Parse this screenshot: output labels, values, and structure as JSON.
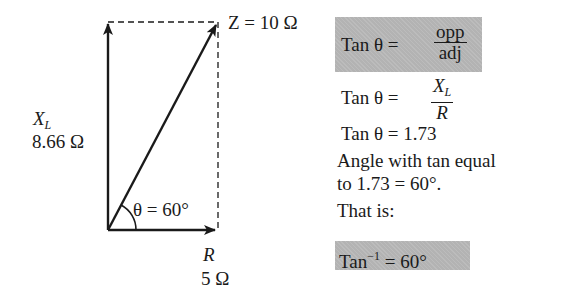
{
  "diagram": {
    "type": "impedance-vector-diagram",
    "impedance": {
      "symbol": "Z",
      "value": "Z = 10 Ω"
    },
    "reactance": {
      "symbol": "X",
      "subscript": "L",
      "value": "8.66 Ω"
    },
    "resistance": {
      "symbol": "R",
      "value": "5 Ω"
    },
    "angle": {
      "label": "θ = 60°"
    }
  },
  "equations": {
    "box1": {
      "prefix": "Tan  θ =",
      "numerator": "opp",
      "denominator": "adj"
    },
    "line2": {
      "prefix": "Tan  θ =",
      "num_symbol": "X",
      "num_sub": "L",
      "denominator": "R"
    },
    "line3": "Tan  θ = 1.73",
    "line4": "Angle with tan equal",
    "line5": "to 1.73 = 60°.",
    "line6": "That is:",
    "box2": {
      "prefix": "Tan",
      "superscript": "−1",
      "suffix": " = 60°"
    }
  },
  "colors": {
    "highlight": "#b3b3b3",
    "ink": "#1a1a1a"
  }
}
